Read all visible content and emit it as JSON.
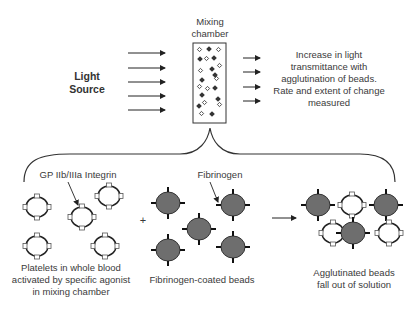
{
  "light_source": {
    "line1": "Light",
    "line2": "Source"
  },
  "mixing_chamber": {
    "line1": "Mixing",
    "line2": "chamber"
  },
  "measurement_text": {
    "line1": "Increase in light",
    "line2": "transmittance with",
    "line3": "agglutination of beads.",
    "line4": "Rate and extent of change",
    "line5": "measured"
  },
  "labels": {
    "integrin": "GP IIb/IIIa Integrin",
    "fibrinogen": "Fibrinogen",
    "plus": "+"
  },
  "captions": {
    "platelets": {
      "line1": "Platelets in whole blood",
      "line2": "activated by specific agonist",
      "line3": "in mixing chamber"
    },
    "beads": {
      "line1": "Fibrinogen-coated beads"
    },
    "agglutinated": {
      "line1": "Agglutinated beads",
      "line2": "fall out of solution"
    }
  },
  "colors": {
    "line": "#222222",
    "bead_fill": "#6e6e6e",
    "platelet_fill": "#ffffff",
    "text": "#3a3a3a"
  }
}
